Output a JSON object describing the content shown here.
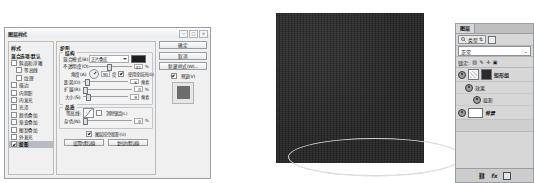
{
  "dialog": {
    "title": "图层样式",
    "window_controls": [
      "—",
      "□",
      "×"
    ],
    "style_list": {
      "title": "样式",
      "items": [
        {
          "label": "混合选项:默认",
          "checked": false,
          "head": true,
          "sub": false,
          "selected": false
        },
        {
          "label": "斜面和浮雕",
          "checked": false,
          "head": false,
          "sub": false,
          "selected": false
        },
        {
          "label": "等高线",
          "checked": false,
          "head": false,
          "sub": true,
          "selected": false
        },
        {
          "label": "纹理",
          "checked": false,
          "head": false,
          "sub": true,
          "selected": false
        },
        {
          "label": "描边",
          "checked": false,
          "head": false,
          "sub": false,
          "selected": false
        },
        {
          "label": "内阴影",
          "checked": false,
          "head": false,
          "sub": false,
          "selected": false
        },
        {
          "label": "内发光",
          "checked": false,
          "head": false,
          "sub": false,
          "selected": false
        },
        {
          "label": "光泽",
          "checked": false,
          "head": false,
          "sub": false,
          "selected": false
        },
        {
          "label": "颜色叠加",
          "checked": false,
          "head": false,
          "sub": false,
          "selected": false
        },
        {
          "label": "渐变叠加",
          "checked": false,
          "head": false,
          "sub": false,
          "selected": false
        },
        {
          "label": "图案叠加",
          "checked": false,
          "head": false,
          "sub": false,
          "selected": false
        },
        {
          "label": "外发光",
          "checked": false,
          "head": false,
          "sub": false,
          "selected": false
        },
        {
          "label": "投影",
          "checked": true,
          "head": false,
          "sub": false,
          "selected": true
        }
      ]
    },
    "main": {
      "section_title": "投影",
      "structure": {
        "legend": "结构",
        "blend_mode_label": "混合模式(B):",
        "blend_mode_value": "正片叠底",
        "color_swatch": "#1c1c1c",
        "opacity_label": "不透明度(O):",
        "opacity_value": "42",
        "opacity_unit": "%",
        "angle_label": "角度(A):",
        "angle_value": "90",
        "angle_unit": "度",
        "use_global_light": "使用全局光(G)",
        "distance_label": "距离(D):",
        "distance_value": "6",
        "distance_unit": "像素",
        "spread_label": "扩展(R):",
        "spread_value": "0",
        "spread_unit": "%",
        "size_label": "大小(S):",
        "size_value": "9",
        "size_unit": "像素"
      },
      "quality": {
        "legend": "品质",
        "contour_label": "等高线:",
        "anti_alias": "消除锯齿(L)",
        "noise_label": "杂色(N):",
        "noise_value": "0",
        "noise_unit": "%",
        "knockout": "图层挖空投影(U)",
        "set_default_button": "设置为默认值",
        "reset_default_button": "复位为默认值"
      }
    },
    "actions": {
      "ok": "确定",
      "cancel": "取消",
      "new_style": "新建样式(W)...",
      "preview_label": "预览(V)",
      "preview_checked": true
    }
  },
  "canvas": {
    "background_color": "#2b2b2b",
    "selection_shape": "ellipse-marquee"
  },
  "layers_panel": {
    "tab": "图层",
    "filter_label": "类型",
    "filter_icon": "search-icon",
    "blend_mode": "正常",
    "lock_label": "锁定:",
    "lock_icons": [
      "transparency-lock-icon",
      "brush-lock-icon",
      "move-lock-icon",
      "all-lock-icon"
    ],
    "layers": [
      {
        "name": "矩形组",
        "type": "group",
        "visible": true,
        "italic": false
      },
      {
        "name": "效果",
        "type": "effects",
        "visible": true,
        "indent": 1
      },
      {
        "name": "投影",
        "type": "effect-item",
        "visible": true,
        "indent": 2
      },
      {
        "name": "背景",
        "type": "background",
        "visible": true,
        "italic": true
      }
    ],
    "toolbar_icons": [
      "link-icon",
      "fx-icon",
      "mask-icon"
    ]
  }
}
